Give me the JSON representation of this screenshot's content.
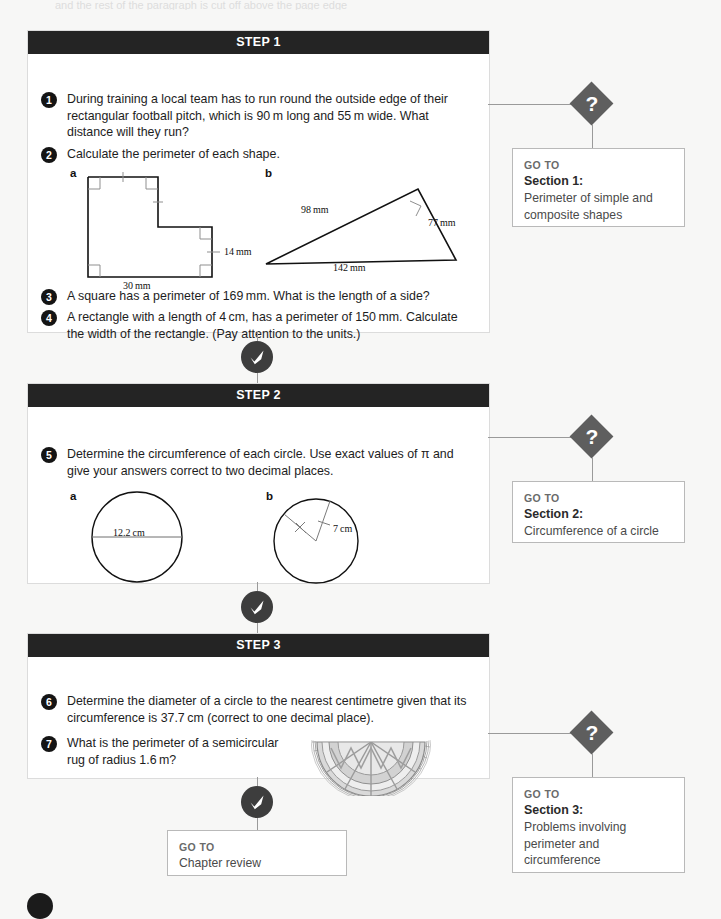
{
  "page": {
    "top_ghost_text": "and the rest of the paragraph is cut off above the page edge",
    "background": "#f7f7f6"
  },
  "steps": [
    {
      "header": "STEP 1",
      "questions": [
        {
          "number": "1",
          "text": "During training a local team has to run round the outside edge of their rectangular football pitch, which is 90 m long and 55 m wide. What distance will they run?"
        },
        {
          "number": "2",
          "text": "Calculate the perimeter of each shape."
        },
        {
          "number": "3",
          "text": "A square has a perimeter of 169 mm. What is the length of a side?"
        },
        {
          "number": "4",
          "text": "A rectangle with a length of 4 cm, has a perimeter of 150 mm. Calculate the width of the rectangle. (Pay attention to the units.)"
        }
      ],
      "figures": [
        {
          "letter": "a",
          "type": "composite-L-shape",
          "labels": [
            "14 mm",
            "30 mm"
          ]
        },
        {
          "letter": "b",
          "type": "right-triangle",
          "labels": [
            "98 mm",
            "77 mm",
            "142 mm"
          ]
        }
      ]
    },
    {
      "header": "STEP 2",
      "questions": [
        {
          "number": "5",
          "text": "Determine the circumference of each circle. Use exact values of π and give your answers correct to two decimal places."
        }
      ],
      "figures": [
        {
          "letter": "a",
          "type": "circle-diameter",
          "labels": [
            "12.2 cm"
          ]
        },
        {
          "letter": "b",
          "type": "circle-radius",
          "labels": [
            "7 cm"
          ]
        }
      ]
    },
    {
      "header": "STEP 3",
      "questions": [
        {
          "number": "6",
          "text": "Determine the diameter of a circle to the nearest centimetre given that its circumference is 37.7 cm (correct to one decimal place)."
        },
        {
          "number": "7",
          "text": "What is the perimeter of a semicircular rug of radius 1.6 m?"
        }
      ],
      "figures": [
        {
          "letter": "",
          "type": "semicircular-rug",
          "labels": []
        }
      ]
    }
  ],
  "goto_boxes": [
    {
      "label": "GO TO",
      "section": "Section 1:",
      "description": "Perimeter of simple and composite shapes"
    },
    {
      "label": "GO TO",
      "section": "Section 2:",
      "description": "Circumference of a circle"
    },
    {
      "label": "GO TO",
      "section": "Section 3:",
      "description": "Problems involving perimeter and circumference"
    },
    {
      "label": "GO TO",
      "section": "",
      "description": "Chapter review"
    }
  ],
  "icons": {
    "question_marker": "?",
    "check_marker": "check-mark"
  },
  "colors": {
    "header_bar": "#242424",
    "diamond": "#5e5e5e",
    "check_circle": "#3d3d3d",
    "connector": "#9a9a9a",
    "goto_label": "#6a6a6a"
  }
}
